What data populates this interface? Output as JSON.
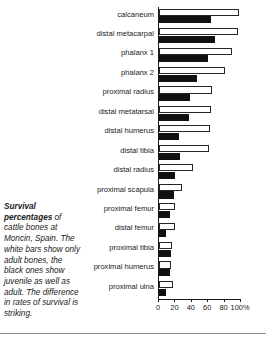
{
  "caption": {
    "lead": "Survival percentages",
    "rest": " of cattle bones at Moncin, Spain. The white bars show only adult bones, the black ones show juvenile as well as adult. The difference in rates of survival is striking."
  },
  "chart_data": {
    "type": "bar",
    "orientation": "horizontal",
    "title": "",
    "xlabel": "",
    "ylabel": "",
    "xlim": [
      0,
      100
    ],
    "xticks": [
      0,
      20,
      40,
      60,
      80,
      100
    ],
    "xticklabels": [
      "0",
      "20",
      "40",
      "60",
      "80",
      "100%"
    ],
    "grid": false,
    "legend": "none",
    "categories": [
      "calcaneum",
      "distal metacarpal",
      "phalanx 1",
      "phalanx 2",
      "proximal radius",
      "distal metatarsal",
      "distal humerus",
      "distal tibia",
      "distal radius",
      "proximal scapula",
      "proximal femur",
      "distal femur",
      "proximal tibia",
      "proximal humerus",
      "proximal ulna"
    ],
    "series": [
      {
        "name": "adult bones only (white bars)",
        "color": "#ffffff",
        "edgecolor": "#262626",
        "values": [
          98,
          96,
          89,
          80,
          65,
          64,
          62,
          61,
          41,
          28,
          19,
          20,
          16,
          15,
          17
        ]
      },
      {
        "name": "juvenile as well as adult (black bars)",
        "color": "#111111",
        "edgecolor": "#111111",
        "values": [
          63,
          68,
          60,
          46,
          38,
          36,
          24,
          26,
          20,
          18,
          13,
          9,
          15,
          14,
          8
        ]
      }
    ]
  }
}
